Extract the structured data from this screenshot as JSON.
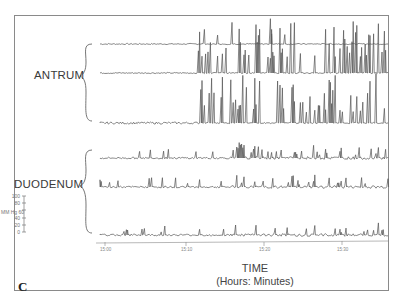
{
  "chart_data": {
    "type": "line",
    "title": "",
    "panel_label": "C",
    "xlabel": "TIME",
    "xlabel_sub": "(Hours: Minutes)",
    "ylabel": "MM Hg",
    "y_scale_ticks": [
      "100",
      "80",
      "60",
      "40",
      "20",
      "0"
    ],
    "x_tick_labels": [
      "15:00",
      "15:10",
      "15:20",
      "15:30"
    ],
    "grid": false,
    "groups": [
      {
        "name": "ANTRUM",
        "channels": 3
      },
      {
        "name": "DUODENUM",
        "channels": 3
      }
    ],
    "series": [
      {
        "name": "Antrum channel 1",
        "group": "ANTRUM",
        "baseline_y": 44,
        "description": "low-amplitude baseline, tall spikes in middle section overlapping from channel 2"
      },
      {
        "name": "Antrum channel 2",
        "group": "ANTRUM",
        "baseline_y": 73,
        "description": "quiet first third, then rhythmic high-amplitude contractions (~3/min) through remainder"
      },
      {
        "name": "Antrum channel 3",
        "group": "ANTRUM",
        "baseline_y": 123,
        "description": "small noisy activity first third, then high-amplitude rhythmic contractions"
      },
      {
        "name": "Duodenum channel 1",
        "group": "DUODENUM",
        "baseline_y": 158,
        "description": "irregular low-moderate activity with bursts near middle and right"
      },
      {
        "name": "Duodenum channel 2",
        "group": "DUODENUM",
        "baseline_y": 187,
        "description": "irregular low-amplitude activity increasing in second half"
      },
      {
        "name": "Duodenum channel 3",
        "group": "DUODENUM",
        "baseline_y": 235,
        "description": "irregular low-amplitude activity increasing in second half"
      }
    ]
  },
  "labels": {
    "antrum": "ANTRUM",
    "duodenum": "DUODENUM",
    "unit": "MM Hg",
    "scale": [
      "100",
      "80",
      "60",
      "40",
      "20",
      "0"
    ],
    "ticks": [
      "15:00",
      "15:10",
      "15:20",
      "15:30"
    ],
    "xlabel": "TIME",
    "xsublabel": "(Hours: Minutes)",
    "panel": "C"
  }
}
